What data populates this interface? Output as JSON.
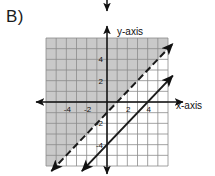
{
  "figure": {
    "problem_label": "B)",
    "x_axis_label": "x-axis",
    "y_axis_label": "y-axis"
  },
  "chart_data": {
    "type": "line",
    "title": "",
    "xlabel": "x-axis",
    "ylabel": "y-axis",
    "xlim": [
      -6,
      6
    ],
    "ylim": [
      -6,
      6
    ],
    "grid": true,
    "grid_step": 1,
    "legend": "none",
    "x_tick_labels": [
      "-4",
      "-2",
      "2",
      "4"
    ],
    "x_tick_values": [
      -4,
      -2,
      2,
      4
    ],
    "y_tick_labels": [
      "4",
      "2",
      "-2",
      "-4"
    ],
    "y_tick_values": [
      4,
      2,
      -2,
      -4
    ],
    "colors": {
      "shade": "#c9c9c9",
      "line": "#1a1a1a",
      "grid": "#8c8c8c",
      "axis": "#111111",
      "background": "#ffffff"
    },
    "series": [
      {
        "name": "boundary-upper",
        "equation": "y = x - 1",
        "slope": 1,
        "intercept": -1,
        "style": "dashed",
        "arrows": "both"
      },
      {
        "name": "boundary-lower",
        "equation": "y = x - 4",
        "slope": 1,
        "intercept": -4,
        "style": "solid",
        "arrows": "both"
      }
    ],
    "shaded_regions": [
      {
        "name": "solution-region",
        "description": "Region above and left of the dashed line y = x - 1",
        "inequality": "y > x - 1",
        "fill": "#c9c9c9"
      }
    ]
  }
}
